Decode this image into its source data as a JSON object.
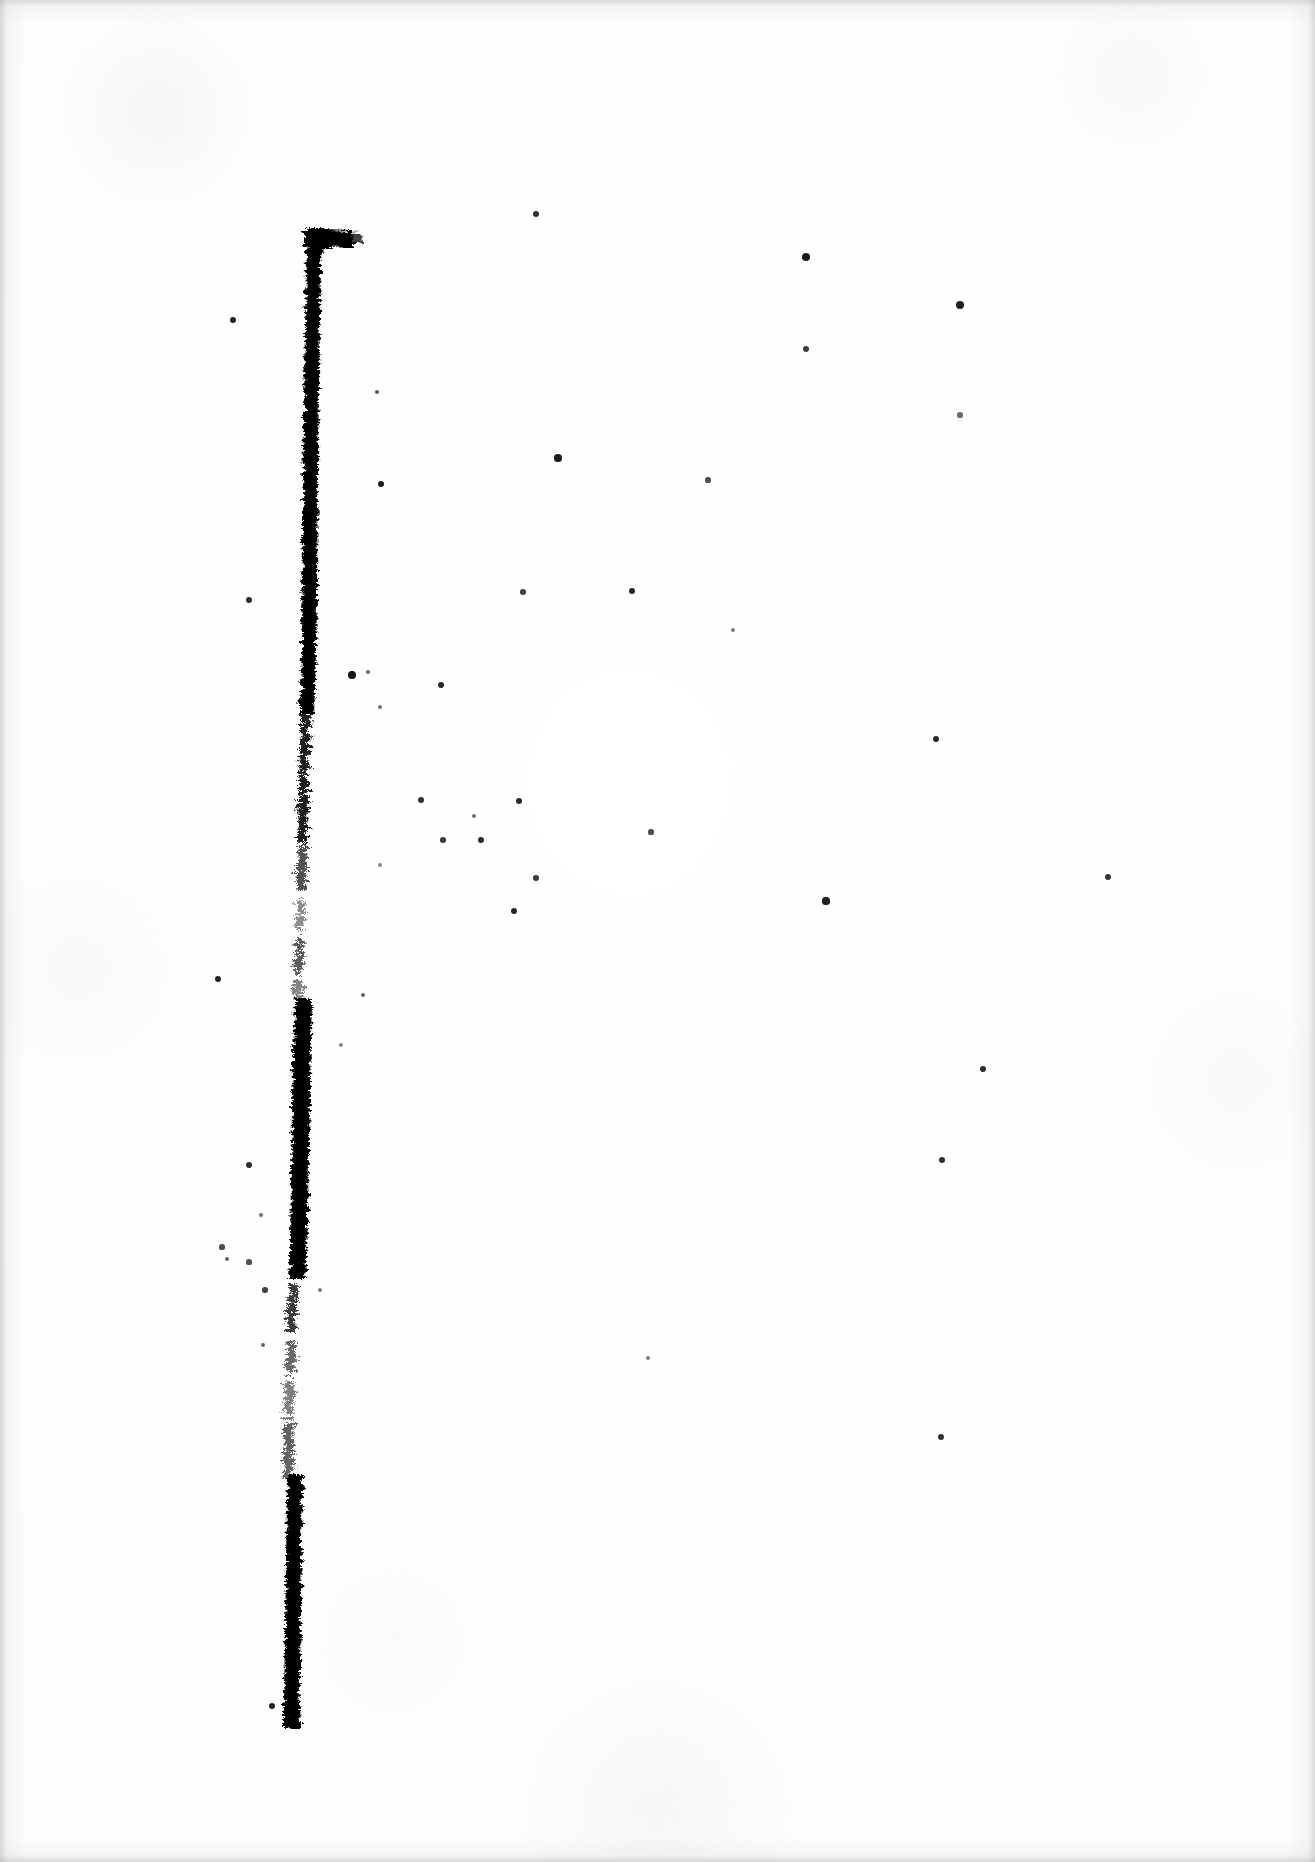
{
  "document": {
    "type": "scanned-page",
    "page_width": 1315,
    "page_height": 1862,
    "background_color": "#ffffff",
    "ink_color": "#000000",
    "edge_shadow_color": "#b0b0b0",
    "visible_text": "",
    "description": "Blank scanned sheet bearing a single heavy black vertical rule with a short horizontal foot at its top, plus scattered dust specks."
  },
  "artwork": {
    "mark_name": "vertical-rule-with-top-serif",
    "shape": "gamma",
    "stroke_color": "#000000",
    "top_y": 228,
    "bottom_y": 1727,
    "top_x": 318,
    "bottom_x": 290,
    "top_serif": {
      "name": "top-horizontal-serif",
      "x_start": 300,
      "x_end": 352,
      "y": 236,
      "thickness": 17
    },
    "segments": [
      {
        "name": "upper-solid",
        "y_start": 228,
        "y_end": 712,
        "density": "heavy",
        "width": 14
      },
      {
        "name": "fading-taper",
        "y_start": 712,
        "y_end": 840,
        "density": "light",
        "width": 8
      },
      {
        "name": "broken-gap",
        "y_start": 840,
        "y_end": 1000,
        "density": "sparse",
        "width": 7
      },
      {
        "name": "middle-blotch",
        "y_start": 1000,
        "y_end": 1275,
        "density": "heavy",
        "width": 17
      },
      {
        "name": "thin-dotted",
        "y_start": 1275,
        "y_end": 1475,
        "density": "sparse",
        "width": 8
      },
      {
        "name": "lower-solid",
        "y_start": 1475,
        "y_end": 1727,
        "density": "heavy",
        "width": 15
      }
    ]
  },
  "specks": [
    {
      "x": 536,
      "y": 214,
      "r": 3.0,
      "o": 0.85
    },
    {
      "x": 806,
      "y": 257,
      "r": 4.0,
      "o": 0.95
    },
    {
      "x": 806,
      "y": 349,
      "r": 3.0,
      "o": 0.8
    },
    {
      "x": 960,
      "y": 305,
      "r": 4.0,
      "o": 0.92
    },
    {
      "x": 960,
      "y": 415,
      "r": 2.6,
      "o": 0.6
    },
    {
      "x": 233,
      "y": 320,
      "r": 3.4,
      "o": 0.9
    },
    {
      "x": 377,
      "y": 392,
      "r": 2.4,
      "o": 0.7
    },
    {
      "x": 381,
      "y": 484,
      "r": 3.4,
      "o": 0.92
    },
    {
      "x": 558,
      "y": 458,
      "r": 3.6,
      "o": 0.92
    },
    {
      "x": 708,
      "y": 480,
      "r": 2.6,
      "o": 0.72
    },
    {
      "x": 523,
      "y": 592,
      "r": 2.8,
      "o": 0.78
    },
    {
      "x": 632,
      "y": 591,
      "r": 3.4,
      "o": 0.9
    },
    {
      "x": 249,
      "y": 600,
      "r": 3.0,
      "o": 0.85
    },
    {
      "x": 733,
      "y": 630,
      "r": 2.2,
      "o": 0.55
    },
    {
      "x": 936,
      "y": 739,
      "r": 3.2,
      "o": 0.88
    },
    {
      "x": 352,
      "y": 675,
      "r": 3.8,
      "o": 0.95
    },
    {
      "x": 368,
      "y": 672,
      "r": 2.2,
      "o": 0.6
    },
    {
      "x": 441,
      "y": 685,
      "r": 3.2,
      "o": 0.88
    },
    {
      "x": 380,
      "y": 707,
      "r": 2.2,
      "o": 0.58
    },
    {
      "x": 421,
      "y": 800,
      "r": 3.0,
      "o": 0.85
    },
    {
      "x": 443,
      "y": 840,
      "r": 2.8,
      "o": 0.8
    },
    {
      "x": 481,
      "y": 840,
      "r": 3.2,
      "o": 0.88
    },
    {
      "x": 380,
      "y": 865,
      "r": 2.0,
      "o": 0.5
    },
    {
      "x": 519,
      "y": 801,
      "r": 3.2,
      "o": 0.88
    },
    {
      "x": 651,
      "y": 832,
      "r": 2.6,
      "o": 0.72
    },
    {
      "x": 474,
      "y": 816,
      "r": 2.2,
      "o": 0.58
    },
    {
      "x": 536,
      "y": 878,
      "r": 2.8,
      "o": 0.8
    },
    {
      "x": 1108,
      "y": 877,
      "r": 3.0,
      "o": 0.82
    },
    {
      "x": 826,
      "y": 901,
      "r": 3.6,
      "o": 0.92
    },
    {
      "x": 514,
      "y": 911,
      "r": 3.4,
      "o": 0.9
    },
    {
      "x": 218,
      "y": 979,
      "r": 3.4,
      "o": 0.9
    },
    {
      "x": 983,
      "y": 1069,
      "r": 3.2,
      "o": 0.86
    },
    {
      "x": 363,
      "y": 995,
      "r": 2.4,
      "o": 0.62
    },
    {
      "x": 341,
      "y": 1045,
      "r": 2.0,
      "o": 0.5
    },
    {
      "x": 249,
      "y": 1165,
      "r": 3.2,
      "o": 0.86
    },
    {
      "x": 261,
      "y": 1215,
      "r": 2.2,
      "o": 0.58
    },
    {
      "x": 222,
      "y": 1247,
      "r": 2.6,
      "o": 0.72
    },
    {
      "x": 227,
      "y": 1259,
      "r": 2.4,
      "o": 0.64
    },
    {
      "x": 249,
      "y": 1262,
      "r": 2.6,
      "o": 0.7
    },
    {
      "x": 265,
      "y": 1290,
      "r": 2.8,
      "o": 0.78
    },
    {
      "x": 320,
      "y": 1290,
      "r": 2.2,
      "o": 0.55
    },
    {
      "x": 263,
      "y": 1345,
      "r": 2.4,
      "o": 0.62
    },
    {
      "x": 942,
      "y": 1160,
      "r": 3.2,
      "o": 0.86
    },
    {
      "x": 648,
      "y": 1358,
      "r": 2.2,
      "o": 0.55
    },
    {
      "x": 941,
      "y": 1437,
      "r": 3.0,
      "o": 0.84
    },
    {
      "x": 272,
      "y": 1706,
      "r": 3.4,
      "o": 0.9
    },
    {
      "x": 289,
      "y": 1716,
      "r": 2.4,
      "o": 0.62
    }
  ]
}
